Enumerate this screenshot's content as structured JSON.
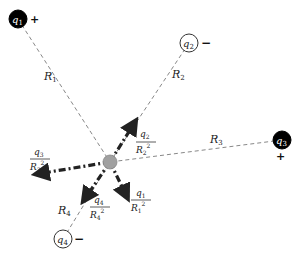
{
  "diagram": {
    "center": {
      "x": 110,
      "y": 162,
      "color": "#a0a0a0"
    },
    "charges": [
      {
        "id": "q1",
        "label": "q",
        "sub": "1",
        "sign": "+",
        "fill": "#000000",
        "text_color": "#ffffff",
        "x": 18,
        "y": 19,
        "sign_x": 34,
        "sign_y": 23
      },
      {
        "id": "q2",
        "label": "q",
        "sub": "2",
        "sign": "−",
        "fill": "#ffffff",
        "text_color": "#000000",
        "x": 189,
        "y": 43,
        "sign_x": 204,
        "sign_y": 47
      },
      {
        "id": "q3",
        "label": "q",
        "sub": "3",
        "sign": "+",
        "fill": "#000000",
        "text_color": "#ffffff",
        "x": 282,
        "y": 140,
        "sign_x": 280,
        "sign_y": 160
      },
      {
        "id": "q4",
        "label": "q",
        "sub": "4",
        "sign": "−",
        "fill": "#ffffff",
        "text_color": "#000000",
        "x": 63,
        "y": 239,
        "sign_x": 76,
        "sign_y": 243
      }
    ],
    "distances": [
      {
        "label": "R",
        "sub": "1",
        "x": 44,
        "y": 80
      },
      {
        "label": "R",
        "sub": "2",
        "x": 172,
        "y": 78
      },
      {
        "label": "R",
        "sub": "3",
        "x": 210,
        "y": 143
      },
      {
        "label": "R",
        "sub": "4",
        "x": 58,
        "y": 214
      }
    ],
    "field_terms": [
      {
        "num": "q",
        "num_sub": "2",
        "den": "R",
        "den_sub": "2",
        "exp": "2",
        "x": 143,
        "y": 135
      },
      {
        "num": "q",
        "num_sub": "3",
        "den": "R",
        "den_sub": "3",
        "exp": "2",
        "x": 33,
        "y": 152
      },
      {
        "num": "q",
        "num_sub": "4",
        "den": "R",
        "den_sub": "4",
        "exp": "2",
        "x": 90,
        "y": 208
      },
      {
        "num": "q",
        "num_sub": "1",
        "den": "R",
        "den_sub": "1",
        "exp": "2",
        "x": 130,
        "y": 195
      }
    ],
    "arrows": [
      {
        "toward": "q2",
        "x2": 135,
        "y2": 122
      },
      {
        "toward": "away-from-q3",
        "x2": 37,
        "y2": 174
      },
      {
        "toward": "q4",
        "x2": 84,
        "y2": 200
      },
      {
        "toward": "away-from-q1",
        "x2": 127,
        "y2": 197
      }
    ]
  }
}
